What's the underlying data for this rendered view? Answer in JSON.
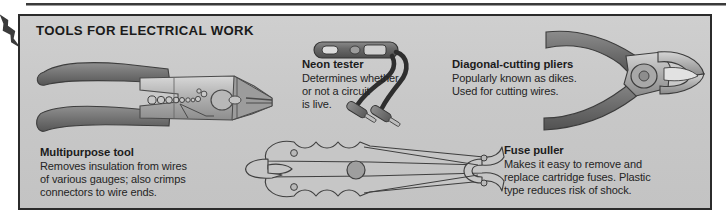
{
  "figure": {
    "title": "TOOLS FOR ELECTRICAL WORK",
    "background_color": "#c9c9c9",
    "border_color": "#2b2b2b",
    "text_color": "#1c1c1c"
  },
  "callouts": {
    "multipurpose": {
      "heading": "Multipurpose tool",
      "line1": "Removes insulation from wires",
      "line2": "of various gauges; also crimps",
      "line3": "connectors to wire ends."
    },
    "neon": {
      "heading": "Neon tester",
      "line1": "Determines whether",
      "line2": "or not a circuit",
      "line3": "is live."
    },
    "diagonal": {
      "heading": "Diagonal-cutting pliers",
      "line1": "Popularly known as dikes.",
      "line2": "Used for cutting wires.",
      "line3": ""
    },
    "fuse": {
      "heading": "Fuse puller",
      "line1": "Makes it easy to remove and",
      "line2": "replace cartridge fuses. Plastic",
      "line3": "type reduces risk of shock."
    }
  },
  "illustrations": {
    "multipurpose_tool": "multipurpose-wire-stripper-crimper",
    "neon_tester": "neon-circuit-tester-with-two-probes",
    "diagonal_pliers": "diagonal-cutting-pliers",
    "fuse_puller": "plastic-fuse-puller"
  }
}
